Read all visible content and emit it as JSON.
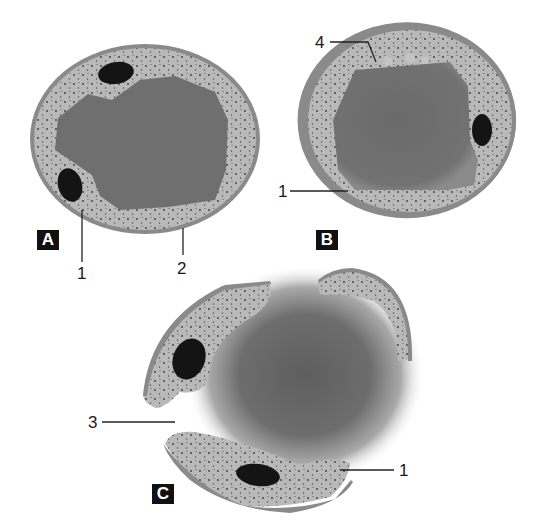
{
  "figure": {
    "panels": [
      {
        "id": "A",
        "badge": "A",
        "description": "Intact cell: central vacuole surrounded by granular cytoplasm, two nuclei, bounded by wall"
      },
      {
        "id": "B",
        "badge": "B",
        "description": "Intact cell with vacuole, one nucleus, small vesicles at periphery"
      },
      {
        "id": "C",
        "badge": "C",
        "description": "Ruptured cell: wall fragments with cytoplasm and nuclei separated, diffuse vacuole content released"
      }
    ],
    "callouts": [
      {
        "panel": "A",
        "number": "1"
      },
      {
        "panel": "A",
        "number": "2"
      },
      {
        "panel": "B",
        "number": "4"
      },
      {
        "panel": "B",
        "number": "1"
      },
      {
        "panel": "C",
        "number": "3"
      },
      {
        "panel": "C",
        "number": "1"
      }
    ],
    "colors": {
      "wall": "#8a8a8a",
      "cytoplasm": "#b9b9b9",
      "vacuole": "#6f6f6f",
      "nucleus": "#141414",
      "badge_bg": "#111111",
      "badge_text": "#ffffff",
      "leader_line": "#222222"
    }
  }
}
